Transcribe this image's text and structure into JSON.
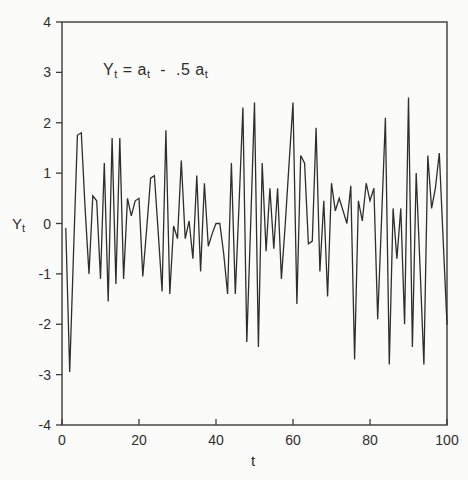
{
  "chart_data": {
    "type": "line",
    "title": "",
    "annotation": "Y_t = a_t - .5 a_t",
    "xlabel": "t",
    "ylabel": "Y_t",
    "xlim": [
      0,
      100
    ],
    "ylim": [
      -4,
      4
    ],
    "x_ticks": [
      0,
      20,
      40,
      60,
      80,
      100
    ],
    "y_ticks": [
      -4,
      -3,
      -2,
      -1,
      0,
      1,
      2,
      3,
      4
    ],
    "grid": false,
    "legend": "none",
    "line_color": "#2e2e2e",
    "x_first": 1,
    "x_step": 1,
    "y": [
      -0.1,
      -2.95,
      -0.6,
      1.75,
      1.8,
      0.3,
      -1.0,
      0.55,
      0.45,
      -1.1,
      1.2,
      -1.55,
      1.7,
      -1.2,
      1.7,
      -1.1,
      0.5,
      0.15,
      0.45,
      0.5,
      -1.05,
      -0.1,
      0.9,
      0.95,
      -0.2,
      -1.35,
      1.85,
      -1.4,
      -0.05,
      -0.3,
      1.25,
      -0.3,
      0.05,
      -0.7,
      0.95,
      -0.95,
      0.8,
      -0.45,
      -0.2,
      0.0,
      0.0,
      -0.6,
      -1.4,
      1.2,
      -1.4,
      0.4,
      2.3,
      -2.35,
      0.0,
      2.4,
      -2.45,
      1.2,
      -0.55,
      0.7,
      -0.5,
      0.7,
      -1.1,
      0.0,
      1.2,
      2.4,
      -1.6,
      1.35,
      1.2,
      -0.4,
      -0.35,
      1.9,
      -0.95,
      0.45,
      -1.45,
      0.8,
      0.25,
      0.5,
      0.25,
      0.0,
      0.75,
      -2.7,
      0.45,
      0.05,
      0.8,
      0.45,
      0.7,
      -1.9,
      0.1,
      2.1,
      -2.8,
      0.3,
      -0.7,
      0.3,
      -2.0,
      2.5,
      -2.45,
      1.0,
      -0.9,
      -2.8,
      1.35,
      0.3,
      0.7,
      1.4,
      -0.3,
      -2.0
    ]
  },
  "formula": {
    "p1": "Y",
    "s1": "t",
    "p2": " = a",
    "s2": "t",
    "p3": "  -  .5 a",
    "s3": "t"
  },
  "ylabel": {
    "main": "Y",
    "sub": "t"
  },
  "xlabel": {
    "main": "t"
  }
}
